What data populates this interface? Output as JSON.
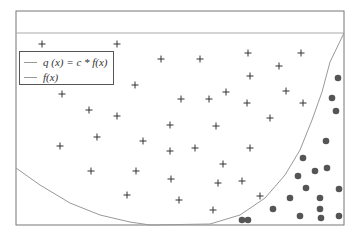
{
  "chart_data": {
    "type": "scatter",
    "title": "",
    "xlabel": "",
    "ylabel": "",
    "grid": false,
    "legend_position": "upper-left",
    "legend": [
      {
        "label": "q (x) = c * f(x)",
        "style": "line",
        "color": "#999999"
      },
      {
        "label": "f(x)",
        "style": "line",
        "color": "#999999"
      }
    ],
    "frame_px": {
      "left": 16,
      "top": 11,
      "right": 344,
      "bottom": 225,
      "inner_top_line": 33
    },
    "series": [
      {
        "name": "rejected",
        "marker": "+",
        "color": "#333333",
        "points_px": [
          [
            42,
            44
          ],
          [
            117,
            44
          ],
          [
            161,
            59
          ],
          [
            200,
            59
          ],
          [
            248,
            53
          ],
          [
            301,
            53
          ],
          [
            250,
            76
          ],
          [
            279,
            66
          ],
          [
            135,
            85
          ],
          [
            62,
            94
          ],
          [
            89,
            110
          ],
          [
            117,
            116
          ],
          [
            181,
            99
          ],
          [
            209,
            99
          ],
          [
            226,
            92
          ],
          [
            247,
            103
          ],
          [
            286,
            91
          ],
          [
            303,
            103
          ],
          [
            270,
            118
          ],
          [
            97,
            137
          ],
          [
            60,
            146
          ],
          [
            143,
            141
          ],
          [
            170,
            125
          ],
          [
            216,
            126
          ],
          [
            170,
            151
          ],
          [
            195,
            148
          ],
          [
            250,
            148
          ],
          [
            223,
            164
          ],
          [
            91,
            171
          ],
          [
            136,
            171
          ],
          [
            171,
            179
          ],
          [
            218,
            183
          ],
          [
            242,
            181
          ],
          [
            127,
            195
          ],
          [
            179,
            200
          ],
          [
            260,
            196
          ],
          [
            213,
            210
          ]
        ]
      },
      {
        "name": "accepted",
        "marker": "o",
        "color": "#555555",
        "points_px": [
          [
            338,
            78
          ],
          [
            332,
            98
          ],
          [
            336,
            111
          ],
          [
            326,
            141
          ],
          [
            303,
            158
          ],
          [
            315,
            171
          ],
          [
            327,
            168
          ],
          [
            298,
            176
          ],
          [
            306,
            188
          ],
          [
            339,
            189
          ],
          [
            290,
            198
          ],
          [
            320,
            198
          ],
          [
            320,
            209
          ],
          [
            273,
            209
          ],
          [
            300,
            216
          ],
          [
            339,
            216
          ],
          [
            321,
            218
          ],
          [
            248,
            220
          ],
          [
            242,
            220
          ]
        ]
      }
    ],
    "curves": [
      {
        "name": "q(x) = c * f(x)",
        "color": "#999999",
        "points_px": [
          [
            150,
            225
          ],
          [
            210,
            224
          ],
          [
            240,
            215
          ],
          [
            265,
            198
          ],
          [
            285,
            175
          ],
          [
            300,
            150
          ],
          [
            312,
            120
          ],
          [
            322,
            92
          ],
          [
            330,
            62
          ],
          [
            344,
            33
          ]
        ]
      },
      {
        "name": "f(x)",
        "color": "#999999",
        "points_px": [
          [
            16,
            168
          ],
          [
            40,
            185
          ],
          [
            70,
            203
          ],
          [
            100,
            215
          ],
          [
            130,
            222
          ],
          [
            150,
            225
          ]
        ]
      }
    ]
  },
  "legend": {
    "q_label": "q (x) = c * f(x)",
    "f_label": "f(x)"
  }
}
